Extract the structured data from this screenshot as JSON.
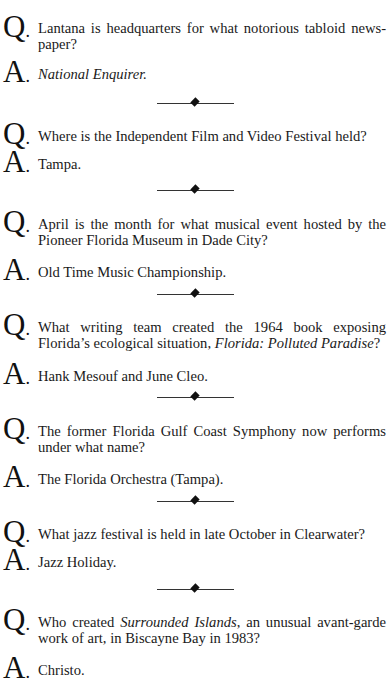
{
  "page": {
    "header": "ARTS & LITERATURE"
  },
  "labels": {
    "question_letter": "Q",
    "answer_letter": "A",
    "dot": "."
  },
  "items": [
    {
      "question": "Lantana is headquarters for what notorious tabloid news-paper?",
      "question_parts": [
        "Lantana is headquarters for what notorious tabloid news-paper?"
      ],
      "answer": "National Enquirer.",
      "answer_italic": true
    },
    {
      "question": "Where is the Independent Film and Video Festival held?",
      "answer": "Tampa.",
      "answer_italic": false
    },
    {
      "question": "April is the month for what musical event hosted by the Pioneer Florida Museum in Dade City?",
      "answer": "Old Time Music Championship.",
      "answer_italic": false
    },
    {
      "question_pre": "What writing team created the 1964 book exposing Florida’s ecological situation, ",
      "question_italic": "Florida: Polluted Paradise",
      "question_post": "?",
      "answer": "Hank Mesouf and June Cleo.",
      "answer_italic": false
    },
    {
      "question": "The former Florida Gulf Coast Symphony now performs under what name?",
      "answer": "The Florida Orchestra (Tampa).",
      "answer_italic": false
    },
    {
      "question": "What jazz festival is held in late October in Clearwater?",
      "answer": "Jazz Holiday.",
      "answer_italic": false
    },
    {
      "question_pre": "Who created ",
      "question_italic": "Surrounded Islands",
      "question_post": ", an unusual avant-garde work of art, in Biscayne Bay in 1983?",
      "answer": "Christo.",
      "answer_italic": false
    }
  ],
  "separator": {
    "icon": "diamond-rule-icon",
    "color": "#111111"
  }
}
